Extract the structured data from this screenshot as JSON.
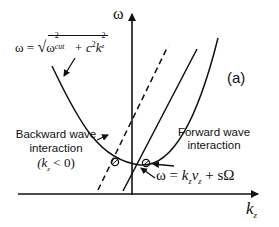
{
  "figure": {
    "panel_label": "(a)",
    "axes": {
      "y_label": "ω",
      "x_label_main": "k",
      "x_label_sub": "z"
    },
    "curves": {
      "waveguide_dispersion": {
        "equation_lhs": "ω = ",
        "equation_sqrt": "√",
        "omega": "ω",
        "omega_sub": "cut",
        "sup2": "2",
        "plus_c": " + c",
        "k": "k",
        "k_sub": "z"
      },
      "beam_line": {
        "equation_prefix": "ω = ",
        "k": "k",
        "k_sub": "z",
        "v": "v",
        "v_sub": "z",
        "suffix": " + sΩ"
      }
    },
    "annotations": {
      "backward_line1": "Backward wave",
      "backward_line2": "interaction",
      "backward_condition": "(k",
      "backward_condition_sub": "z",
      "backward_condition_end": " < 0)",
      "forward_line1": "Forward wave",
      "forward_line2": "interaction"
    },
    "colors": {
      "ink": "#111111",
      "background": "#ffffff"
    }
  }
}
